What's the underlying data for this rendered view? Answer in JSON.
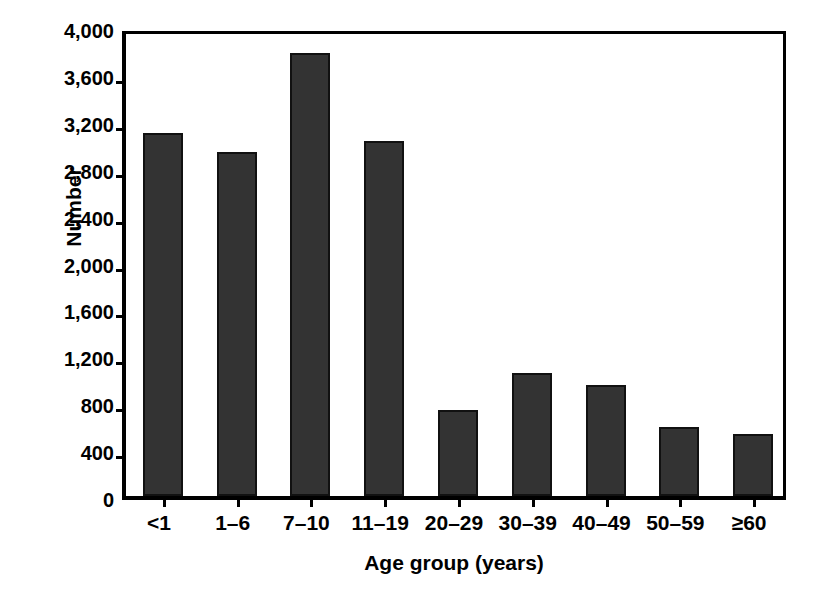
{
  "chart_data": {
    "type": "bar",
    "title": "",
    "subtitle": "",
    "xlabel": "Age group (years)",
    "ylabel": "Number",
    "categories": [
      "<1",
      "1–6",
      "7–10",
      "11–19",
      "20–29",
      "30–39",
      "40–49",
      "50–59",
      "≥60"
    ],
    "values": [
      3100,
      2930,
      3780,
      3030,
      730,
      1050,
      950,
      590,
      530
    ],
    "ylim": [
      0,
      4000
    ],
    "ytick_labels": [
      "4,000",
      "3,600",
      "3,200",
      "2,800",
      "2,400",
      "2,000",
      "1,600",
      "1,200",
      "800",
      "400",
      "0"
    ],
    "ytick_values": [
      4000,
      3600,
      3200,
      2800,
      2400,
      2000,
      1600,
      1200,
      800,
      400,
      0
    ],
    "ytick_step": 400,
    "grid": false,
    "legend": false,
    "legend_position": "none",
    "bar_color": "#333333",
    "bar_edge_color": "#111111",
    "axis_color": "#000000",
    "background_color": "#ffffff"
  }
}
